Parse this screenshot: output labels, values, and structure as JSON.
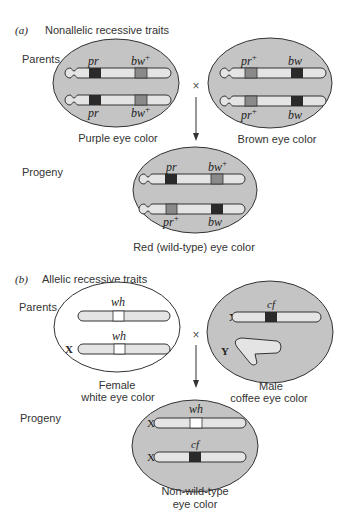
{
  "panel_a": {
    "label": "(a)",
    "title": "Nonallelic recessive traits",
    "parents_label": "Parents",
    "progeny_label": "Progeny",
    "cross_symbol": "×",
    "parent_left": {
      "caption": "Purple eye color",
      "chromosomes": [
        {
          "genes": [
            {
              "name": "pr",
              "sup": "",
              "shade": "dark"
            },
            {
              "name": "bw",
              "sup": "+",
              "shade": "mid"
            }
          ]
        },
        {
          "genes": [
            {
              "name": "pr",
              "sup": "",
              "shade": "dark"
            },
            {
              "name": "bw",
              "sup": "+",
              "shade": "mid"
            }
          ]
        }
      ]
    },
    "parent_right": {
      "caption": "Brown eye color",
      "chromosomes": [
        {
          "genes": [
            {
              "name": "pr",
              "sup": "+",
              "shade": "mid"
            },
            {
              "name": "bw",
              "sup": "",
              "shade": "dark"
            }
          ]
        },
        {
          "genes": [
            {
              "name": "pr",
              "sup": "+",
              "shade": "mid"
            },
            {
              "name": "bw",
              "sup": "",
              "shade": "dark"
            }
          ]
        }
      ]
    },
    "progeny": {
      "caption": "Red (wild-type) eye color",
      "chromosomes": [
        {
          "genes": [
            {
              "name": "pr",
              "sup": "",
              "shade": "dark"
            },
            {
              "name": "bw",
              "sup": "+",
              "shade": "mid"
            }
          ]
        },
        {
          "genes": [
            {
              "name": "pr",
              "sup": "+",
              "shade": "mid"
            },
            {
              "name": "bw",
              "sup": "",
              "shade": "dark"
            }
          ]
        }
      ]
    }
  },
  "panel_b": {
    "label": "(b)",
    "title": "Allelic recessive traits",
    "parents_label": "Parents",
    "progeny_label": "Progeny",
    "cross_symbol": "×",
    "parent_left": {
      "caption_line1": "Female",
      "caption_line2": "white eye color",
      "chromosomes": [
        {
          "label": "",
          "gene": "wh",
          "shade": "white"
        },
        {
          "label": "X",
          "gene": "wh",
          "shade": "white"
        }
      ]
    },
    "parent_right": {
      "caption_line1": "Male",
      "caption_line2": "coffee eye color",
      "chromosomes": [
        {
          "label": "X",
          "gene": "cf",
          "shade": "dark"
        },
        {
          "label": "Y",
          "gene": "",
          "shade": ""
        }
      ]
    },
    "progeny": {
      "caption_line1": "Non-wild-type",
      "caption_line2": "eye color",
      "chromosomes": [
        {
          "label": "X",
          "gene": "wh",
          "shade": "white"
        },
        {
          "label": "X",
          "gene": "cf",
          "shade": "dark"
        }
      ]
    }
  },
  "colors": {
    "cell_fill": "#c4c4c4",
    "chromosome_fill": "#e4e4e4",
    "dark_band": "#2a2a2a",
    "mid_band": "#8a8a8a"
  }
}
